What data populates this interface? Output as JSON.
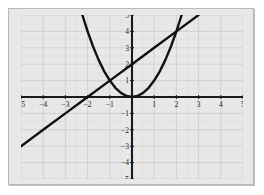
{
  "chart_data": {
    "type": "line",
    "title": "",
    "subtitle": "",
    "xlabel": "",
    "ylabel": "",
    "xlim": [
      -5,
      5
    ],
    "ylim": [
      -5,
      5
    ],
    "grid": true,
    "grid_minor": true,
    "legend": "none",
    "background_color": "#e8e8e8",
    "grid_color": "#c9c9c9",
    "axis_color": "#1a1a1a",
    "curve_color": "#111111",
    "x_ticks": [
      -5,
      -4,
      -3,
      -2,
      -1,
      1,
      2,
      3,
      4,
      5
    ],
    "y_ticks": [
      -5,
      -4,
      -3,
      -2,
      -1,
      1,
      2,
      3,
      4,
      5
    ],
    "x_tick_labels": [
      "−5",
      "−4",
      "−3",
      "−2",
      "−1",
      "1",
      "2",
      "3",
      "4",
      "5"
    ],
    "y_tick_labels": [
      "−5",
      "−4",
      "−3",
      "−2",
      "−1",
      "1",
      "2",
      "3",
      "4",
      "5"
    ],
    "series": [
      {
        "name": "line",
        "equation": "y = x + 2",
        "type": "line",
        "x_domain": [
          -5,
          3
        ],
        "points": [
          {
            "x": -5,
            "y": -3
          },
          {
            "x": -4,
            "y": -2
          },
          {
            "x": -3,
            "y": -1
          },
          {
            "x": -2,
            "y": 0
          },
          {
            "x": -1,
            "y": 1
          },
          {
            "x": 0,
            "y": 2
          },
          {
            "x": 1,
            "y": 3
          },
          {
            "x": 2,
            "y": 4
          },
          {
            "x": 3,
            "y": 5
          }
        ]
      },
      {
        "name": "parabola",
        "equation": "y = x^2",
        "type": "curve",
        "x_domain": [
          -2.236,
          2.236
        ],
        "points": [
          {
            "x": -2.236,
            "y": 5
          },
          {
            "x": -2,
            "y": 4
          },
          {
            "x": -1.75,
            "y": 3.0625
          },
          {
            "x": -1.5,
            "y": 2.25
          },
          {
            "x": -1.25,
            "y": 1.5625
          },
          {
            "x": -1,
            "y": 1
          },
          {
            "x": -0.75,
            "y": 0.5625
          },
          {
            "x": -0.5,
            "y": 0.25
          },
          {
            "x": -0.25,
            "y": 0.0625
          },
          {
            "x": 0,
            "y": 0
          },
          {
            "x": 0.25,
            "y": 0.0625
          },
          {
            "x": 0.5,
            "y": 0.25
          },
          {
            "x": 0.75,
            "y": 0.5625
          },
          {
            "x": 1,
            "y": 1
          },
          {
            "x": 1.25,
            "y": 1.5625
          },
          {
            "x": 1.5,
            "y": 2.25
          },
          {
            "x": 1.75,
            "y": 3.0625
          },
          {
            "x": 2,
            "y": 4
          },
          {
            "x": 2.236,
            "y": 5
          }
        ]
      }
    ],
    "intersections": [
      {
        "x": -1,
        "y": 1
      },
      {
        "x": 2,
        "y": 4
      }
    ]
  }
}
